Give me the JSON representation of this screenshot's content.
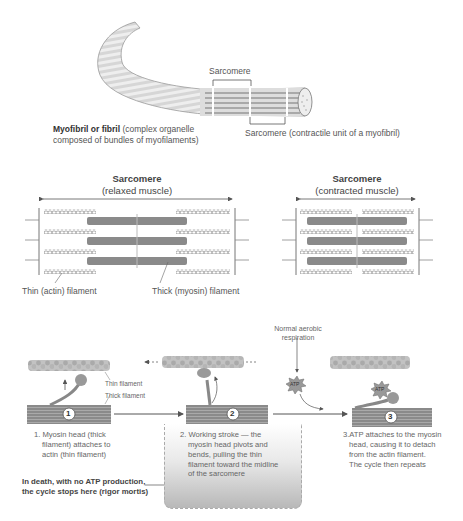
{
  "myofibril": {
    "sarcomere_top_label": "Sarcomere",
    "main_label_bold": "Myofibril or fibril",
    "main_label_rest_line1": " (complex organelle",
    "main_label_line2": "composed of bundles of myofilaments)",
    "sarcomere_bottom_label": "Sarcomere (contractile unit of a myofibril)"
  },
  "sarcomeres": {
    "relaxed": {
      "title": "Sarcomere",
      "subtitle": "(relaxed muscle)"
    },
    "contracted": {
      "title": "Sarcomere",
      "subtitle": "(contracted muscle)"
    },
    "thin_label": "Thin (actin) filament",
    "thick_label": "Thick (myosin) filament"
  },
  "cycle": {
    "respiration_label_line1": "Normal aerobic",
    "respiration_label_line2": "respiration",
    "thin_filament_label": "Thin filament",
    "thick_filament_label": "Thick filament",
    "atp_label": "ATP",
    "steps": [
      {
        "number": "1",
        "text_lines": [
          "1. Myosin head (thick",
          "filament) attaches to",
          "actin (thin filament)"
        ]
      },
      {
        "number": "2",
        "text_lines": [
          "2. Working stroke — the",
          "myosin head pivots and",
          "bends, pulling the thin",
          "filament toward the midline",
          "of the sarcomere"
        ]
      },
      {
        "number": "3",
        "text_lines": [
          "3.ATP attaches to the myosin",
          "head, causing it to detach",
          "from the actin filament.",
          "The cycle then repeats"
        ]
      }
    ],
    "rigor_line1": "In death, with no ATP production,",
    "rigor_line2": "the cycle stops here (rigor mortis)"
  }
}
